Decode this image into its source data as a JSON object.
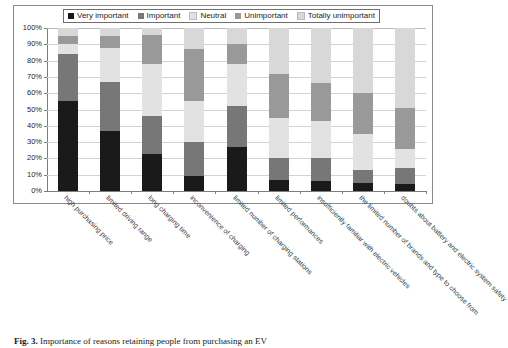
{
  "caption": {
    "number": "Fig. 3.",
    "text": "Importance of reasons retaining people from purchasing an EV"
  },
  "chart_data": {
    "type": "bar",
    "title": "",
    "xlabel": "",
    "ylabel": "",
    "ylim": [
      0,
      100
    ],
    "grid": true,
    "stacked": true,
    "stack_mode": "percent",
    "legend_position": "top",
    "ytick_labels": [
      "0%",
      "10%",
      "20%",
      "30%",
      "40%",
      "50%",
      "60%",
      "70%",
      "80%",
      "90%",
      "100%"
    ],
    "ytick_values": [
      0,
      10,
      20,
      30,
      40,
      50,
      60,
      70,
      80,
      90,
      100
    ],
    "categories": [
      "high purchasing price",
      "limited driving range",
      "long charging time",
      "inconvenience of charging",
      "limited number of charging stations",
      "limited performances",
      "insufficiently familiar with electric vehicles",
      "the limited number of brands and type to choose from",
      "doubts about battery and electric system safety"
    ],
    "series": [
      {
        "name": "Very important",
        "color": "#1a1a1a",
        "values": [
          55,
          37,
          23,
          9,
          27,
          7,
          6,
          5,
          4
        ]
      },
      {
        "name": "Important",
        "color": "#777777",
        "values": [
          29,
          30,
          23,
          21,
          25,
          13,
          14,
          8,
          10
        ]
      },
      {
        "name": "Neutral",
        "color": "#e2e2e2",
        "values": [
          6,
          21,
          32,
          25,
          26,
          25,
          23,
          22,
          12
        ]
      },
      {
        "name": "Unimportant",
        "color": "#999999",
        "values": [
          5,
          7,
          18,
          32,
          12,
          27,
          23,
          25,
          25
        ]
      },
      {
        "name": "Totally unimportant",
        "color": "#d8d8d8",
        "values": [
          5,
          5,
          4,
          13,
          10,
          28,
          34,
          40,
          49
        ]
      }
    ]
  }
}
